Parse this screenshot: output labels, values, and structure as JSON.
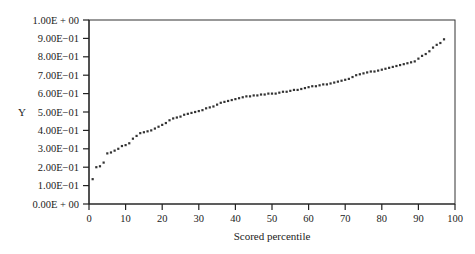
{
  "chart_data": {
    "type": "scatter",
    "title": "",
    "xlabel": "Scored percentile",
    "ylabel": "Y",
    "xlim": [
      0,
      100
    ],
    "ylim": [
      0,
      1
    ],
    "grid": false,
    "legend": null,
    "x_ticks": [
      "0",
      "10",
      "20",
      "30",
      "40",
      "50",
      "60",
      "70",
      "80",
      "90",
      "100"
    ],
    "x_tick_values": [
      0,
      10,
      20,
      30,
      40,
      50,
      60,
      70,
      80,
      90,
      100
    ],
    "y_ticks": [
      "0.00E + 00",
      "1.00E−01",
      "2.00E−01",
      "3.00E−01",
      "4.00E−01",
      "5.00E−01",
      "6.00E−01",
      "7.00E−01",
      "8.00E−01",
      "9.00E−01",
      "1.00E + 00"
    ],
    "y_tick_values": [
      0,
      0.1,
      0.2,
      0.3,
      0.4,
      0.5,
      0.6,
      0.7,
      0.8,
      0.9,
      1.0
    ],
    "series": [
      {
        "name": "Y",
        "x": [
          1,
          2,
          3,
          4,
          5,
          6,
          7,
          8,
          9,
          10,
          11,
          12,
          13,
          14,
          15,
          16,
          17,
          18,
          19,
          20,
          21,
          22,
          23,
          24,
          25,
          26,
          27,
          28,
          29,
          30,
          31,
          32,
          33,
          34,
          35,
          36,
          37,
          38,
          39,
          40,
          41,
          42,
          43,
          44,
          45,
          46,
          47,
          48,
          49,
          50,
          51,
          52,
          53,
          54,
          55,
          56,
          57,
          58,
          59,
          60,
          61,
          62,
          63,
          64,
          65,
          66,
          67,
          68,
          69,
          70,
          71,
          72,
          73,
          74,
          75,
          76,
          77,
          78,
          79,
          80,
          81,
          82,
          83,
          84,
          85,
          86,
          87,
          88,
          89,
          90,
          91,
          92,
          93,
          94,
          95,
          96,
          97
        ],
        "y": [
          0.135,
          0.2,
          0.205,
          0.225,
          0.275,
          0.28,
          0.29,
          0.3,
          0.315,
          0.32,
          0.33,
          0.355,
          0.37,
          0.385,
          0.39,
          0.395,
          0.4,
          0.41,
          0.42,
          0.43,
          0.44,
          0.455,
          0.465,
          0.47,
          0.475,
          0.485,
          0.49,
          0.495,
          0.5,
          0.505,
          0.51,
          0.52,
          0.525,
          0.53,
          0.54,
          0.55,
          0.555,
          0.56,
          0.565,
          0.57,
          0.575,
          0.58,
          0.585,
          0.585,
          0.59,
          0.59,
          0.595,
          0.595,
          0.6,
          0.6,
          0.6,
          0.605,
          0.61,
          0.61,
          0.615,
          0.62,
          0.62,
          0.625,
          0.63,
          0.635,
          0.64,
          0.64,
          0.645,
          0.65,
          0.65,
          0.655,
          0.66,
          0.665,
          0.67,
          0.675,
          0.68,
          0.69,
          0.7,
          0.705,
          0.71,
          0.715,
          0.72,
          0.72,
          0.725,
          0.73,
          0.735,
          0.74,
          0.745,
          0.75,
          0.755,
          0.76,
          0.765,
          0.77,
          0.775,
          0.79,
          0.805,
          0.815,
          0.83,
          0.85,
          0.865,
          0.875,
          0.895
        ]
      }
    ]
  }
}
